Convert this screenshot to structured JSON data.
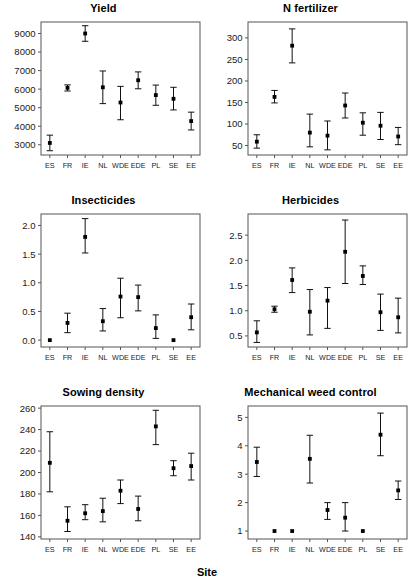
{
  "figure": {
    "xlabel": "Site",
    "categories": [
      "ES",
      "FR",
      "IE",
      "NL",
      "WDE",
      "EDE",
      "PL",
      "SE",
      "EE"
    ]
  },
  "chart_data": [
    {
      "type": "scatter",
      "title": "Yield",
      "xlabel": "Site",
      "ylabel": "",
      "categories": [
        "ES",
        "FR",
        "IE",
        "NL",
        "WDE",
        "EDE",
        "PL",
        "SE",
        "EE"
      ],
      "values": [
        3100,
        6070,
        9000,
        6100,
        5280,
        6480,
        5680,
        5480,
        4280
      ],
      "err_low": [
        2680,
        5900,
        8580,
        5220,
        4350,
        6020,
        5130,
        4880,
        3800
      ],
      "err_high": [
        3520,
        6230,
        9420,
        6980,
        6150,
        6930,
        6220,
        6100,
        4760
      ],
      "yticks": [
        3000,
        4000,
        5000,
        6000,
        7000,
        8000,
        9000
      ],
      "ylim": [
        2450,
        9620
      ],
      "grid": false,
      "legend": "none"
    },
    {
      "type": "scatter",
      "title": "N fertilizer",
      "xlabel": "Site",
      "ylabel": "",
      "categories": [
        "ES",
        "FR",
        "IE",
        "NL",
        "WDE",
        "EDE",
        "PL",
        "SE",
        "EE"
      ],
      "values": [
        59,
        163,
        282,
        80,
        73,
        143,
        103,
        96,
        71
      ],
      "err_low": [
        44,
        149,
        242,
        47,
        40,
        114,
        74,
        64,
        52
      ],
      "err_high": [
        75,
        178,
        321,
        123,
        107,
        172,
        126,
        127,
        92
      ],
      "yticks": [
        50,
        100,
        150,
        200,
        250,
        300
      ],
      "ylim": [
        28,
        337
      ],
      "grid": false,
      "legend": "none"
    },
    {
      "type": "scatter",
      "title": "Insecticides",
      "xlabel": "Site",
      "ylabel": "",
      "categories": [
        "ES",
        "FR",
        "IE",
        "NL",
        "WDE",
        "EDE",
        "PL",
        "SE",
        "EE"
      ],
      "values": [
        0.0,
        0.3,
        1.8,
        0.33,
        0.76,
        0.75,
        0.21,
        0.0,
        0.4
      ],
      "err_low": [
        0.0,
        0.13,
        1.52,
        0.16,
        0.39,
        0.51,
        0.03,
        0.0,
        0.18
      ],
      "err_high": [
        0.0,
        0.47,
        2.12,
        0.55,
        1.08,
        0.96,
        0.44,
        0.0,
        0.63
      ],
      "yticks": [
        0.0,
        0.5,
        1.0,
        1.5,
        2.0
      ],
      "ylim": [
        -0.12,
        2.2
      ],
      "grid": false,
      "legend": "none"
    },
    {
      "type": "scatter",
      "title": "Herbicides",
      "xlabel": "Site",
      "ylabel": "",
      "categories": [
        "ES",
        "FR",
        "IE",
        "NL",
        "WDE",
        "EDE",
        "PL",
        "SE",
        "EE"
      ],
      "values": [
        0.57,
        1.03,
        1.61,
        0.98,
        1.2,
        2.17,
        1.69,
        0.97,
        0.87
      ],
      "err_low": [
        0.37,
        0.97,
        1.36,
        0.52,
        0.65,
        1.54,
        1.52,
        0.61,
        0.56
      ],
      "err_high": [
        0.8,
        1.09,
        1.85,
        1.42,
        1.46,
        2.8,
        1.89,
        1.33,
        1.25
      ],
      "yticks": [
        0.5,
        1.0,
        1.5,
        2.0,
        2.5
      ],
      "ylim": [
        0.28,
        2.92
      ],
      "grid": false,
      "legend": "none"
    },
    {
      "type": "scatter",
      "title": "Sowing density",
      "xlabel": "Site",
      "ylabel": "",
      "categories": [
        "ES",
        "FR",
        "IE",
        "NL",
        "WDE",
        "EDE",
        "PL",
        "SE",
        "EE"
      ],
      "values": [
        209,
        155,
        162,
        164,
        183,
        166,
        243,
        204,
        206
      ],
      "err_low": [
        182,
        145,
        156,
        154,
        171,
        155,
        226,
        197,
        193
      ],
      "err_high": [
        238,
        168,
        170,
        176,
        193,
        178,
        258,
        211,
        218
      ],
      "yticks": [
        140,
        160,
        180,
        200,
        220,
        240,
        260
      ],
      "ylim": [
        138,
        262
      ],
      "grid": false,
      "legend": "none"
    },
    {
      "type": "scatter",
      "title": "Mechanical weed control",
      "xlabel": "Site",
      "ylabel": "",
      "categories": [
        "ES",
        "FR",
        "IE",
        "NL",
        "WDE",
        "EDE",
        "PL",
        "SE",
        "EE"
      ],
      "values": [
        3.43,
        1.0,
        1.0,
        3.54,
        1.74,
        1.47,
        1.0,
        4.39,
        2.43
      ],
      "err_low": [
        2.92,
        1.0,
        1.0,
        2.69,
        1.41,
        1.0,
        1.0,
        3.65,
        2.11
      ],
      "err_high": [
        3.95,
        1.0,
        1.0,
        4.37,
        2.0,
        2.0,
        1.0,
        5.15,
        2.76
      ],
      "yticks": [
        1,
        2,
        3,
        4,
        5
      ],
      "ylim": [
        0.72,
        5.4
      ],
      "grid": false,
      "legend": "none"
    }
  ]
}
